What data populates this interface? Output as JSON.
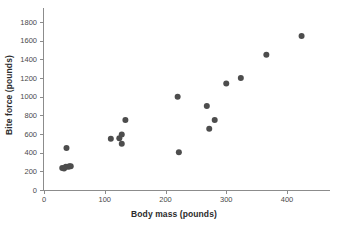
{
  "chart": {
    "y_axis_title": "Bite force (pounds)",
    "x_axis_title": "Body mass (pounds)"
  },
  "chart_data": {
    "type": "scatter",
    "title": "",
    "subtitle": "",
    "xlabel": "Body mass (pounds)",
    "ylabel": "Bite force (pounds)",
    "xlim": [
      0,
      450
    ],
    "ylim": [
      0,
      1900
    ],
    "x_ticks": [
      0,
      100,
      200,
      300,
      400
    ],
    "y_ticks": [
      0,
      200,
      400,
      600,
      800,
      1000,
      1200,
      1400,
      1600,
      1800
    ],
    "grid": false,
    "legend": null,
    "marker": {
      "shape": "circle",
      "color": "#4d4d4d",
      "size_px": 3
    },
    "series": [
      {
        "name": "animals",
        "points": [
          {
            "x": 30,
            "y": 235
          },
          {
            "x": 33,
            "y": 230
          },
          {
            "x": 36,
            "y": 250
          },
          {
            "x": 40,
            "y": 250
          },
          {
            "x": 42,
            "y": 255
          },
          {
            "x": 44,
            "y": 255
          },
          {
            "x": 37,
            "y": 450
          },
          {
            "x": 110,
            "y": 550
          },
          {
            "x": 124,
            "y": 555
          },
          {
            "x": 128,
            "y": 595
          },
          {
            "x": 128,
            "y": 495
          },
          {
            "x": 134,
            "y": 750
          },
          {
            "x": 220,
            "y": 1000
          },
          {
            "x": 222,
            "y": 405
          },
          {
            "x": 268,
            "y": 900
          },
          {
            "x": 272,
            "y": 655
          },
          {
            "x": 281,
            "y": 750
          },
          {
            "x": 300,
            "y": 1140
          },
          {
            "x": 324,
            "y": 1200
          },
          {
            "x": 366,
            "y": 1450
          },
          {
            "x": 424,
            "y": 1650
          }
        ]
      }
    ]
  }
}
